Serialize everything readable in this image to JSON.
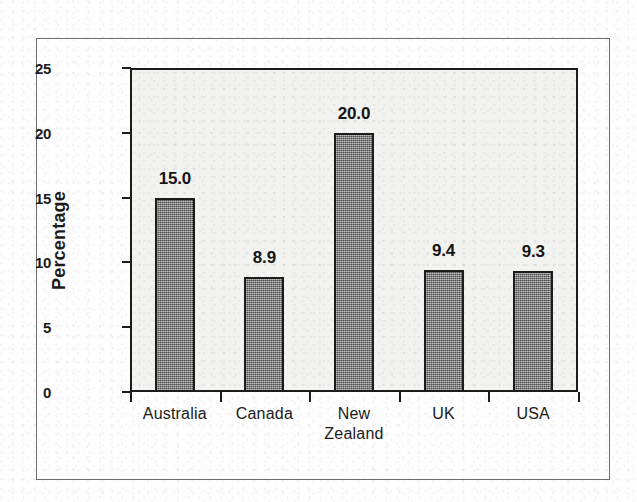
{
  "chart_data": {
    "type": "bar",
    "title": "",
    "subtitle": "",
    "xlabel": "",
    "ylabel": "Percentage",
    "ylim": [
      0,
      25
    ],
    "ytick_labels": [
      "0",
      "5",
      "10",
      "15",
      "20",
      "25"
    ],
    "ytick_values": [
      0,
      5,
      10,
      15,
      20,
      25
    ],
    "grid": false,
    "legend": "none",
    "categories": [
      "Australia",
      "Canada",
      "New Zealand",
      "UK",
      "USA"
    ],
    "category_lines": [
      [
        "Australia"
      ],
      [
        "Canada"
      ],
      [
        "New",
        "Zealand"
      ],
      [
        "UK"
      ],
      [
        "USA"
      ]
    ],
    "values": [
      15.0,
      8.9,
      20.0,
      9.4,
      9.3
    ],
    "value_labels": [
      "15.0",
      "8.9",
      "20.0",
      "9.4",
      "9.3"
    ],
    "bar_color": "#7e7e7e",
    "bar_border_color": "#1b1b1b",
    "plot_background": "#f2f2f0",
    "text_color": "#1b1b1b",
    "frame_color": "#6d6d6d"
  }
}
